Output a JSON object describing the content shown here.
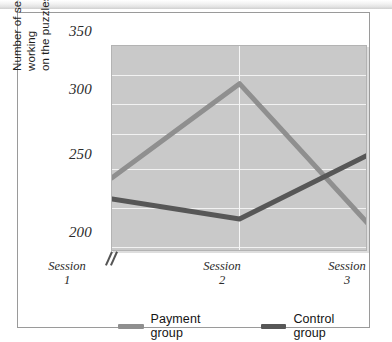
{
  "chart_data": {
    "type": "line",
    "title": "",
    "xlabel": "",
    "ylabel": "Number of seconds spent working on the puzzles during breaks",
    "ylabel_line1": "Number of seconds spent working",
    "ylabel_line2": "on the puzzles during breaks",
    "categories": [
      "Session 1",
      "Session 2",
      "Session 3"
    ],
    "x_tick_lines": [
      {
        "name": "Session",
        "num": "1"
      },
      {
        "name": "Session",
        "num": "2"
      },
      {
        "name": "Session",
        "num": "3"
      }
    ],
    "y_ticks": [
      350,
      300,
      250,
      200
    ],
    "y_tick_labels": [
      "350",
      "300",
      "250",
      "200"
    ],
    "ylim": [
      175,
      350
    ],
    "y_gridlines": [
      325,
      300,
      275,
      250,
      225,
      200,
      175
    ],
    "axis_break": true,
    "grid": true,
    "legend_position": "bottom",
    "series": [
      {
        "name": "Payment group",
        "color": "#8f8f8f",
        "values": [
          238,
          318,
          200
        ]
      },
      {
        "name": "Control group",
        "color": "#575757",
        "values": [
          220,
          203,
          257
        ]
      }
    ]
  },
  "legend": {
    "items": [
      {
        "label": "Payment group",
        "color": "#8f8f8f"
      },
      {
        "label": "Control group",
        "color": "#575757"
      }
    ]
  },
  "colors": {
    "plot_background": "#c9c9c9",
    "gridline": "#f2f2f2",
    "frame": "#9a9a9a",
    "payment_series": "#8f8f8f",
    "control_series": "#575757"
  }
}
